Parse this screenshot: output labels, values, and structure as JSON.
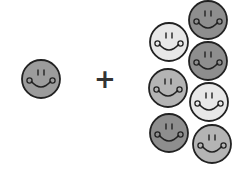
{
  "diagram": {
    "operator": "+",
    "single_face": {
      "id": "single",
      "cx": 41,
      "cy": 79,
      "r": 19,
      "fill": "#9c9c9c"
    },
    "group_faces": [
      {
        "id": "g1",
        "cx": 208,
        "cy": 20,
        "r": 19,
        "fill": "#8e8e8e"
      },
      {
        "id": "g2",
        "cx": 169,
        "cy": 42,
        "r": 19,
        "fill": "#e8e8e8"
      },
      {
        "id": "g3",
        "cx": 208,
        "cy": 61,
        "r": 19,
        "fill": "#8e8e8e"
      },
      {
        "id": "g4",
        "cx": 168,
        "cy": 88,
        "r": 19,
        "fill": "#b4b4b4"
      },
      {
        "id": "g5",
        "cx": 209,
        "cy": 102,
        "r": 19,
        "fill": "#e8e8e8"
      },
      {
        "id": "g6",
        "cx": 169,
        "cy": 133,
        "r": 19,
        "fill": "#8e8e8e"
      },
      {
        "id": "g7",
        "cx": 212,
        "cy": 144,
        "r": 19,
        "fill": "#b4b4b4"
      }
    ],
    "colors": {
      "outline": "#222222",
      "background": "#ffffff",
      "operator": "#333333"
    }
  }
}
